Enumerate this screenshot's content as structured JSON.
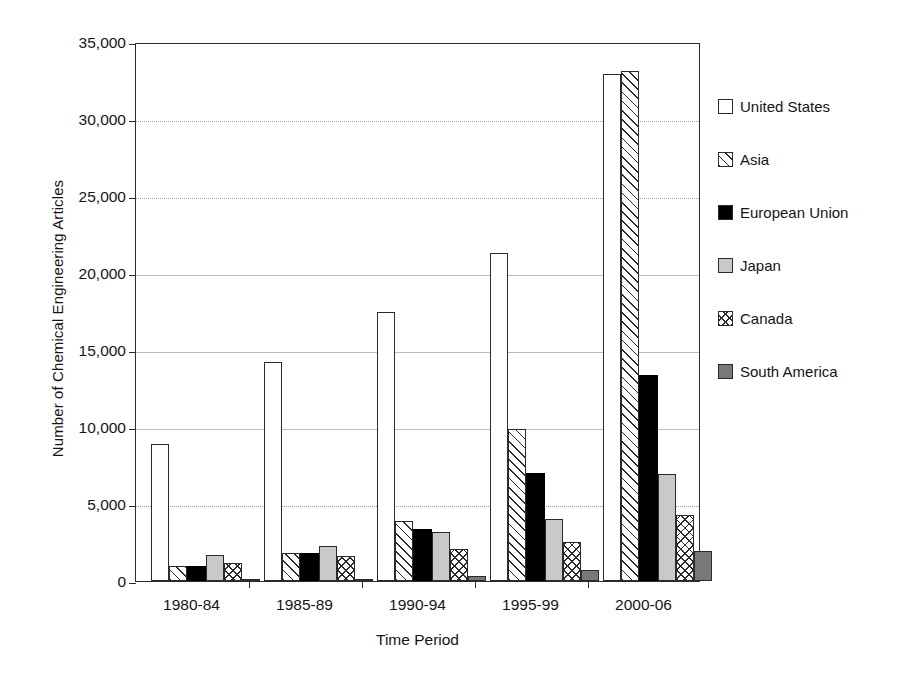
{
  "chart_data": {
    "type": "bar",
    "title": "",
    "xlabel": "Time Period",
    "ylabel": "Number of Chemical Engineering Articles",
    "categories": [
      "1980-84",
      "1985-89",
      "1990-94",
      "1995-99",
      "2000-06"
    ],
    "ylim": [
      0,
      35000
    ],
    "ytick_values": [
      0,
      5000,
      10000,
      15000,
      20000,
      25000,
      30000,
      35000
    ],
    "ytick_labels": [
      "0",
      "5,000",
      "10,000",
      "15,000",
      "20,000",
      "25,000",
      "30,000",
      "35,000"
    ],
    "grid": true,
    "legend_position": "right",
    "series": [
      {
        "name": "United States",
        "fill": "white",
        "values": [
          8900,
          14200,
          17500,
          21300,
          32900
        ]
      },
      {
        "name": "Asia",
        "fill": "diagonal-hatch",
        "values": [
          950,
          1850,
          3900,
          9900,
          33100
        ]
      },
      {
        "name": "European Union",
        "fill": "solid-black",
        "values": [
          950,
          1800,
          3400,
          7000,
          13400
        ]
      },
      {
        "name": "Japan",
        "fill": "light-gray",
        "values": [
          1700,
          2300,
          3200,
          4000,
          6950
        ]
      },
      {
        "name": "Canada",
        "fill": "cross-hatch",
        "values": [
          1200,
          1650,
          2100,
          2550,
          4300
        ]
      },
      {
        "name": "South America",
        "fill": "dark-gray",
        "values": [
          110,
          130,
          300,
          700,
          1950
        ]
      }
    ]
  },
  "legend": {
    "items": [
      {
        "label": "United States",
        "swatch": "white-square-swatch"
      },
      {
        "label": "Asia",
        "swatch": "diagonal-hatch-swatch"
      },
      {
        "label": "European Union",
        "swatch": "solid-black-swatch"
      },
      {
        "label": "Japan",
        "swatch": "light-gray-swatch"
      },
      {
        "label": "Canada",
        "swatch": "cross-hatch-swatch"
      },
      {
        "label": "South America",
        "swatch": "dark-gray-swatch"
      }
    ]
  }
}
